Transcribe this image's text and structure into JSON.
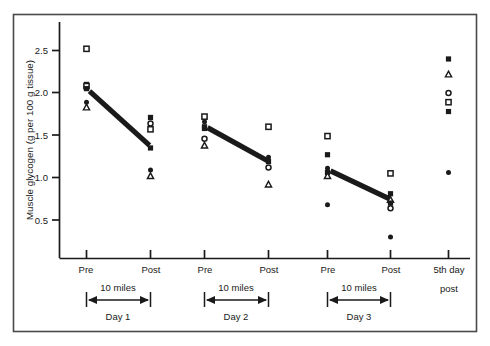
{
  "chart_data": {
    "type": "scatter",
    "title": "",
    "xlabel": "",
    "ylabel": "Muscle glycogen (g per 100 g tissue)",
    "ylim": [
      0.0,
      2.75
    ],
    "yticks": [
      0.5,
      1.0,
      1.5,
      2.0,
      2.5
    ],
    "ytick_labels": [
      "0.5",
      "1.0",
      "1.5",
      "2.0",
      "2.5"
    ],
    "grid": false,
    "legend": "none",
    "xtick_labels": [
      "Pre",
      "Post",
      "Pre",
      "Post",
      "Pre",
      "Post",
      "5th day post"
    ],
    "x_categories": [
      {
        "label": "Pre",
        "day": "Day 1"
      },
      {
        "label": "Post",
        "day": "Day 1"
      },
      {
        "label": "Pre",
        "day": "Day 2"
      },
      {
        "label": "Post",
        "day": "Day 2"
      },
      {
        "label": "Pre",
        "day": "Day 3"
      },
      {
        "label": "Post",
        "day": "Day 3"
      },
      {
        "label": "5th day post",
        "day": ""
      }
    ],
    "span_labels": [
      "10 miles",
      "10 miles",
      "10 miles"
    ],
    "day_labels": [
      "Day 1",
      "Day 2",
      "Day 3"
    ],
    "fifth_day_label_line1": "5th day",
    "fifth_day_label_line2": "post",
    "marker_types": [
      "filled-square",
      "open-square",
      "filled-circle",
      "open-circle",
      "open-triangle"
    ],
    "points": [
      {
        "x": 0,
        "y": 2.52,
        "marker": "open-square"
      },
      {
        "x": 0,
        "y": 2.1,
        "marker": "filled-square"
      },
      {
        "x": 0,
        "y": 2.08,
        "marker": "open-square"
      },
      {
        "x": 0,
        "y": 2.05,
        "marker": "filled-square"
      },
      {
        "x": 0,
        "y": 1.89,
        "marker": "filled-circle"
      },
      {
        "x": 0,
        "y": 1.83,
        "marker": "open-triangle"
      },
      {
        "x": 1,
        "y": 1.71,
        "marker": "filled-square"
      },
      {
        "x": 1,
        "y": 1.64,
        "marker": "open-circle"
      },
      {
        "x": 1,
        "y": 1.57,
        "marker": "open-square"
      },
      {
        "x": 1,
        "y": 1.35,
        "marker": "filled-square"
      },
      {
        "x": 1,
        "y": 1.09,
        "marker": "filled-circle"
      },
      {
        "x": 1,
        "y": 1.02,
        "marker": "open-triangle"
      },
      {
        "x": 2,
        "y": 1.72,
        "marker": "open-square"
      },
      {
        "x": 2,
        "y": 1.66,
        "marker": "filled-circle"
      },
      {
        "x": 2,
        "y": 1.6,
        "marker": "filled-square"
      },
      {
        "x": 2,
        "y": 1.58,
        "marker": "filled-square"
      },
      {
        "x": 2,
        "y": 1.46,
        "marker": "open-circle"
      },
      {
        "x": 2,
        "y": 1.38,
        "marker": "open-triangle"
      },
      {
        "x": 3,
        "y": 1.6,
        "marker": "open-square"
      },
      {
        "x": 3,
        "y": 1.24,
        "marker": "filled-circle"
      },
      {
        "x": 3,
        "y": 1.19,
        "marker": "filled-square"
      },
      {
        "x": 3,
        "y": 1.12,
        "marker": "open-circle"
      },
      {
        "x": 3,
        "y": 0.92,
        "marker": "open-triangle"
      },
      {
        "x": 4,
        "y": 1.49,
        "marker": "open-square"
      },
      {
        "x": 4,
        "y": 1.27,
        "marker": "filled-square"
      },
      {
        "x": 4,
        "y": 1.11,
        "marker": "filled-circle"
      },
      {
        "x": 4,
        "y": 1.06,
        "marker": "filled-square"
      },
      {
        "x": 4,
        "y": 1.02,
        "marker": "open-triangle"
      },
      {
        "x": 4,
        "y": 0.68,
        "marker": "filled-circle"
      },
      {
        "x": 5,
        "y": 1.05,
        "marker": "open-square"
      },
      {
        "x": 5,
        "y": 0.81,
        "marker": "filled-square"
      },
      {
        "x": 5,
        "y": 0.74,
        "marker": "open-triangle"
      },
      {
        "x": 5,
        "y": 0.7,
        "marker": "filled-square"
      },
      {
        "x": 5,
        "y": 0.64,
        "marker": "open-circle"
      },
      {
        "x": 5,
        "y": 0.3,
        "marker": "filled-circle"
      },
      {
        "x": 6,
        "y": 2.4,
        "marker": "filled-square"
      },
      {
        "x": 6,
        "y": 2.22,
        "marker": "open-triangle"
      },
      {
        "x": 6,
        "y": 2.0,
        "marker": "open-circle"
      },
      {
        "x": 6,
        "y": 1.89,
        "marker": "open-square"
      },
      {
        "x": 6,
        "y": 1.78,
        "marker": "filled-square"
      },
      {
        "x": 6,
        "y": 1.06,
        "marker": "filled-circle"
      }
    ],
    "trend_lines": [
      {
        "day": "Day 1",
        "x0": 0,
        "y0": 2.02,
        "x1": 1,
        "y1": 1.38
      },
      {
        "day": "Day 2",
        "x0": 2,
        "y0": 1.59,
        "x1": 3,
        "y1": 1.2
      },
      {
        "day": "Day 3",
        "x0": 4,
        "y0": 1.08,
        "x1": 5,
        "y1": 0.75
      }
    ]
  },
  "colors": {
    "ink": "#1a1a1a",
    "frame": "#4a4a4a",
    "background": "#ffffff"
  }
}
